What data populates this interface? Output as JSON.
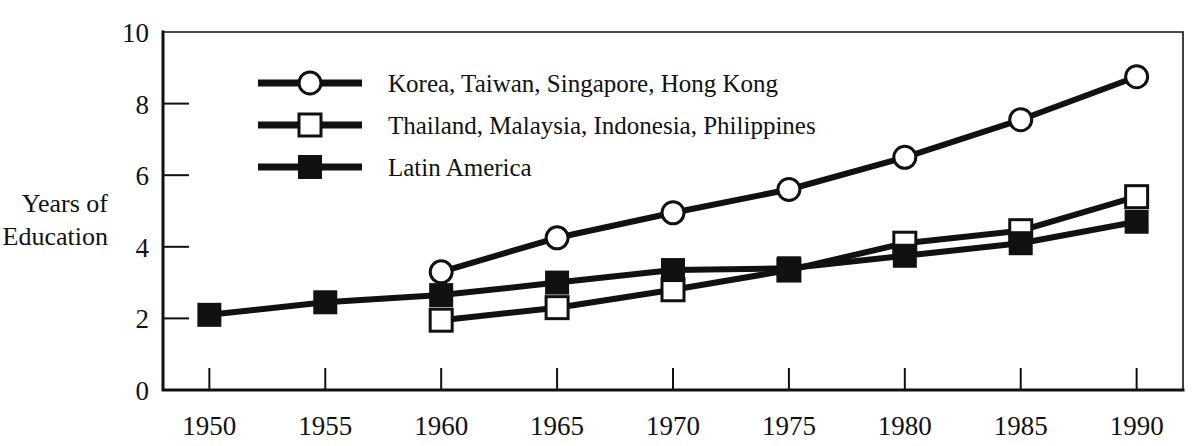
{
  "chart_data": {
    "type": "line",
    "title": "",
    "xlabel": "",
    "ylabel": "Years of Education",
    "ylabel_line1": "Years of",
    "ylabel_line2": "Education",
    "x": [
      1950,
      1955,
      1960,
      1965,
      1970,
      1975,
      1980,
      1985,
      1990
    ],
    "xtick_labels": [
      "1950",
      "1955",
      "1960",
      "1965",
      "1970",
      "1975",
      "1980",
      "1985",
      "1990"
    ],
    "ytick_labels": [
      "0",
      "2",
      "4",
      "6",
      "8",
      "10"
    ],
    "yticks": [
      0,
      2,
      4,
      6,
      8,
      10
    ],
    "xlim": [
      1948,
      1992
    ],
    "ylim": [
      0,
      10
    ],
    "grid": false,
    "legend_position": "upper-left-inside",
    "series": [
      {
        "name": "Korea, Taiwan, Singapore, Hong Kong",
        "marker": "open-circle",
        "color": "#111111",
        "x": [
          1960,
          1965,
          1970,
          1975,
          1980,
          1985,
          1990
        ],
        "values": [
          3.3,
          4.25,
          4.95,
          5.6,
          6.5,
          7.55,
          8.75
        ]
      },
      {
        "name": "Thailand, Malaysia, Indonesia, Philippines",
        "marker": "open-square",
        "color": "#111111",
        "x": [
          1960,
          1965,
          1970,
          1975,
          1980,
          1985,
          1990
        ],
        "values": [
          1.95,
          2.3,
          2.8,
          3.35,
          4.1,
          4.45,
          5.4
        ]
      },
      {
        "name": "Latin America",
        "marker": "filled-square",
        "color": "#111111",
        "x": [
          1950,
          1955,
          1960,
          1965,
          1970,
          1975,
          1980,
          1985,
          1990
        ],
        "values": [
          2.1,
          2.45,
          2.65,
          3.0,
          3.35,
          3.4,
          3.75,
          4.1,
          4.7
        ]
      }
    ]
  },
  "legend": {
    "entries": [
      {
        "label": "Korea, Taiwan, Singapore, Hong Kong",
        "marker": "open-circle"
      },
      {
        "label": "Thailand, Malaysia, Indonesia, Philippines",
        "marker": "open-square"
      },
      {
        "label": "Latin America",
        "marker": "filled-square"
      }
    ]
  },
  "colors": {
    "ink": "#111111",
    "background": "#ffffff"
  }
}
